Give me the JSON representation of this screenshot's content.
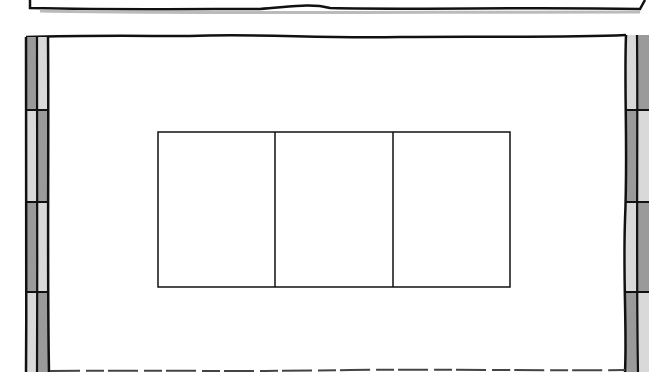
{
  "scene": {
    "description": "Hand-drawn comic panel: interior wall with bamboo-like pillars on both sides and a three-pane window in the center",
    "colors": {
      "ink": "#111111",
      "background": "#ffffff",
      "pillar_dark": "#9a9a9a",
      "pillar_light": "#d9d9d9",
      "shadow": "#bbbbbb"
    },
    "window": {
      "panes": 3
    },
    "pillars": {
      "left": "bamboo-pillar",
      "right": "bamboo-pillar"
    }
  }
}
